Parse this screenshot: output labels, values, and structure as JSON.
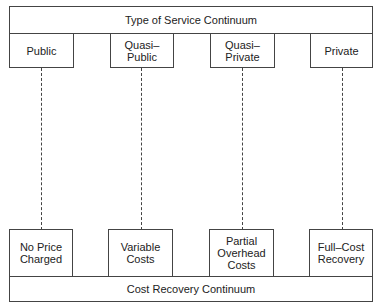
{
  "header": {
    "title": "Type of Service Continuum"
  },
  "service_types": [
    {
      "label": "Public"
    },
    {
      "label": "Quasi–\nPublic"
    },
    {
      "label": "Quasi–\nPrivate"
    },
    {
      "label": "Private"
    }
  ],
  "cost_levels": [
    {
      "label": "No Price\nCharged"
    },
    {
      "label": "Variable\nCosts"
    },
    {
      "label": "Partial\nOverhead\nCosts"
    },
    {
      "label": "Full–Cost\nRecovery"
    }
  ],
  "footer": {
    "title": "Cost Recovery Continuum"
  }
}
